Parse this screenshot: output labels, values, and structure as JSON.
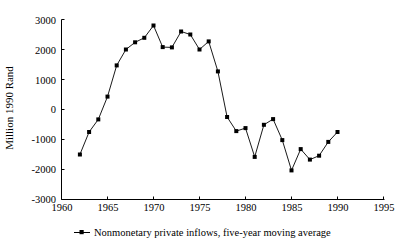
{
  "chart_data": {
    "type": "line",
    "title": "",
    "xlabel": "",
    "ylabel": "Million 1990 Rand",
    "xlim": [
      1960,
      1995
    ],
    "ylim": [
      -3000,
      3000
    ],
    "xticks": [
      1960,
      1965,
      1970,
      1975,
      1980,
      1985,
      1990,
      1995
    ],
    "xtick_labels": [
      "1960",
      "1965",
      "1970",
      "1975",
      "1980",
      "1985",
      "1990",
      "1995"
    ],
    "yticks": [
      -3000,
      -2000,
      -1000,
      0,
      1000,
      2000,
      3000
    ],
    "ytick_labels": [
      "-3000",
      "-2000",
      "-1000",
      "0",
      "1000",
      "2000",
      "3000"
    ],
    "grid": false,
    "legend_position": "below",
    "marker": "square",
    "line_color": "#000000",
    "marker_color": "#000000",
    "series": [
      {
        "name": "Nonmonetary private inflows, five-year moving average",
        "x": [
          1962,
          1963,
          1964,
          1965,
          1966,
          1967,
          1968,
          1969,
          1970,
          1971,
          1972,
          1973,
          1974,
          1975,
          1976,
          1977,
          1978,
          1979,
          1980,
          1981,
          1982,
          1983,
          1984,
          1985,
          1986,
          1987,
          1988,
          1989,
          1990
        ],
        "values": [
          -1500,
          -750,
          -330,
          430,
          1470,
          2000,
          2240,
          2390,
          2800,
          2080,
          2070,
          2600,
          2500,
          2000,
          2270,
          1270,
          -250,
          -720,
          -620,
          -1580,
          -510,
          -320,
          -1020,
          -2030,
          -1320,
          -1670,
          -1540,
          -1080,
          -750
        ]
      }
    ]
  },
  "legend": {
    "entries": [
      {
        "label": "Nonmonetary private inflows, five-year moving average",
        "marker": "square-line-marker"
      }
    ]
  },
  "axes": {
    "y_axis_title": "Million 1990 Rand"
  }
}
